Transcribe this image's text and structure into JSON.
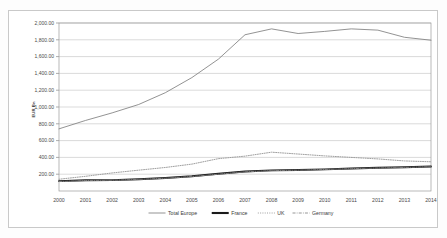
{
  "chart_data": {
    "type": "line",
    "title": "",
    "xlabel": "",
    "ylabel": "EUR Bn",
    "ylim": [
      0,
      2000
    ],
    "ytick_values": [
      200,
      400,
      600,
      800,
      1000,
      1200,
      1400,
      1600,
      1800,
      2000
    ],
    "ytick_labels": [
      "200.00",
      "400.00",
      "600.00",
      "800.00",
      "1,000.00",
      "1,200.00",
      "1,400.00",
      "1,600.00",
      "1,800.00",
      "2,000.00"
    ],
    "grid": true,
    "legend_position": "bottom",
    "categories": [
      "2000",
      "2001",
      "2002",
      "2003",
      "2004",
      "2005",
      "2006",
      "2007",
      "2008",
      "2009",
      "2010",
      "2011",
      "2012",
      "2013",
      "2014"
    ],
    "x": [
      2000,
      2001,
      2002,
      2003,
      2004,
      2005,
      2006,
      2007,
      2008,
      2009,
      2010,
      2011,
      2012,
      2013,
      2014
    ],
    "series": [
      {
        "name": "Total Europe",
        "style": "solid-thin",
        "color": "#808080",
        "values": [
          740,
          840,
          930,
          1030,
          1170,
          1350,
          1570,
          1860,
          1930,
          1875,
          1900,
          1930,
          1915,
          1830,
          1795
        ]
      },
      {
        "name": "France",
        "style": "solid-thick",
        "color": "#1a1a1a",
        "values": [
          118,
          128,
          130,
          140,
          155,
          175,
          205,
          232,
          245,
          250,
          258,
          268,
          276,
          282,
          292
        ]
      },
      {
        "name": "UK",
        "style": "dotted",
        "color": "#9a9a9a",
        "values": [
          140,
          175,
          215,
          248,
          280,
          320,
          385,
          415,
          462,
          440,
          418,
          400,
          382,
          358,
          348
        ]
      },
      {
        "name": "Germany",
        "style": "dash-dot",
        "color": "#8a8a8a",
        "values": [
          112,
          125,
          128,
          138,
          152,
          172,
          200,
          228,
          242,
          248,
          256,
          266,
          274,
          280,
          290
        ]
      }
    ]
  },
  "legend": {
    "items": [
      {
        "label": "Total Europe"
      },
      {
        "label": "France"
      },
      {
        "label": "UK"
      },
      {
        "label": "Germany"
      }
    ]
  }
}
